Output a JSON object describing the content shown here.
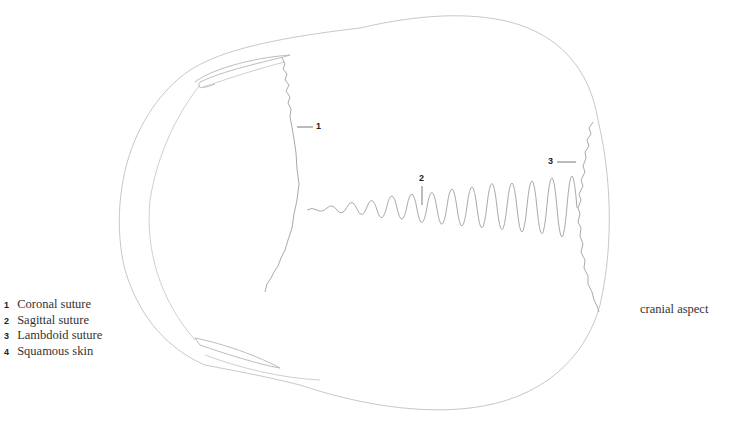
{
  "figure": {
    "view_label": "cranial aspect",
    "legend": [
      {
        "num": "1",
        "label": "Coronal suture"
      },
      {
        "num": "2",
        "label": "Sagittal suture"
      },
      {
        "num": "3",
        "label": "Lambdoid suture"
      },
      {
        "num": "4",
        "label": "Squamous skin"
      }
    ],
    "callouts": [
      {
        "num": "1"
      },
      {
        "num": "2"
      },
      {
        "num": "3"
      }
    ],
    "colors": {
      "outline": "#c8c8c8",
      "suture": "#a8a8a8",
      "leader": "#555555",
      "text": "#333333"
    }
  }
}
